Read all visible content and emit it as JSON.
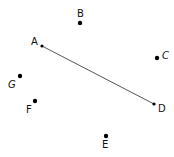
{
  "diagram": {
    "segment": {
      "from": "A",
      "to": "D",
      "color": "#555555"
    },
    "points": [
      {
        "label": "A",
        "x": 42,
        "y": 46,
        "lx": 31,
        "ly": 45,
        "r": 1.6
      },
      {
        "label": "B",
        "x": 80,
        "y": 23,
        "lx": 77,
        "ly": 17,
        "r": 2.2
      },
      {
        "label": "C",
        "x": 157,
        "y": 58,
        "lx": 162,
        "ly": 59,
        "r": 2.2
      },
      {
        "label": "D",
        "x": 154,
        "y": 104,
        "lx": 158,
        "ly": 112,
        "r": 1.6
      },
      {
        "label": "E",
        "x": 106,
        "y": 136,
        "lx": 102,
        "ly": 148,
        "r": 2.2
      },
      {
        "label": "F",
        "x": 35,
        "y": 101,
        "lx": 26,
        "ly": 113,
        "r": 2.2
      },
      {
        "label": "G",
        "x": 20,
        "y": 76,
        "lx": 8,
        "ly": 88,
        "r": 2.2
      }
    ]
  }
}
